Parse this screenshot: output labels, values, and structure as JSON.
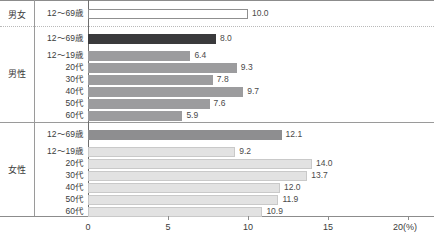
{
  "chart_data": {
    "type": "bar",
    "orientation": "horizontal",
    "title": "",
    "xlabel": "20(%)",
    "ylabel": "",
    "xlim": [
      0,
      20
    ],
    "xticks": [
      0,
      5,
      10,
      15,
      20
    ],
    "xtick_labels": [
      "0",
      "5",
      "10",
      "15",
      "20(%)"
    ],
    "grid": false,
    "legend": "none",
    "groups": [
      {
        "name": "男女",
        "rows": [
          {
            "label": "12～69歳",
            "value": 10.0,
            "value_label": "10.0",
            "color": "#ffffff"
          }
        ]
      },
      {
        "name": "男性",
        "rows": [
          {
            "label": "12～69歳",
            "value": 8.0,
            "value_label": "8.0",
            "color": "#3a3a3c"
          },
          {
            "label": "12～19歳",
            "value": 6.4,
            "value_label": "6.4",
            "color": "#9c9c9e"
          },
          {
            "label": "20代",
            "value": 9.3,
            "value_label": "9.3",
            "color": "#9c9c9e"
          },
          {
            "label": "30代",
            "value": 7.8,
            "value_label": "7.8",
            "color": "#9c9c9e"
          },
          {
            "label": "40代",
            "value": 9.7,
            "value_label": "9.7",
            "color": "#9c9c9e"
          },
          {
            "label": "50代",
            "value": 7.6,
            "value_label": "7.6",
            "color": "#9c9c9e"
          },
          {
            "label": "60代",
            "value": 5.9,
            "value_label": "5.9",
            "color": "#9c9c9e"
          }
        ]
      },
      {
        "name": "女性",
        "rows": [
          {
            "label": "12～69歳",
            "value": 12.1,
            "value_label": "12.1",
            "color": "#8e8e90"
          },
          {
            "label": "12～19歳",
            "value": 9.2,
            "value_label": "9.2",
            "color": "#e2e2e2"
          },
          {
            "label": "20代",
            "value": 14.0,
            "value_label": "14.0",
            "color": "#e2e2e2"
          },
          {
            "label": "30代",
            "value": 13.7,
            "value_label": "13.7",
            "color": "#e2e2e2"
          },
          {
            "label": "40代",
            "value": 12.0,
            "value_label": "12.0",
            "color": "#e2e2e2"
          },
          {
            "label": "50代",
            "value": 11.9,
            "value_label": "11.9",
            "color": "#e2e2e2"
          },
          {
            "label": "60代",
            "value": 10.9,
            "value_label": "10.9",
            "color": "#e2e2e2"
          }
        ]
      }
    ]
  }
}
